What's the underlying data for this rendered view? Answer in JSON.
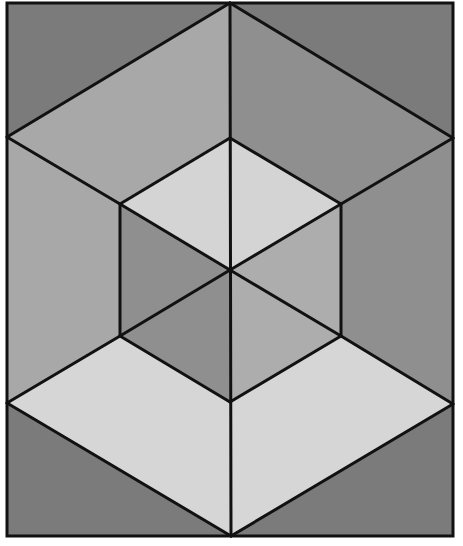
{
  "figure": {
    "width": 463,
    "height": 546,
    "frame": {
      "x": 7,
      "y": 3,
      "w": 446,
      "h": 533
    },
    "stroke_color": "#111111",
    "stroke_width": 3,
    "colors": {
      "dark": "#7b7b7b",
      "medium_dark": "#8c8c8c",
      "medium": "#a3a3a3",
      "light": "#b4b4b4",
      "lightest": "#d6d6d6"
    },
    "regions": [
      {
        "name": "corner-top-left",
        "fill": "#7b7b7b",
        "points": "7,3 230,3 7,137"
      },
      {
        "name": "corner-top-right",
        "fill": "#7b7b7b",
        "points": "230,3 453,3 453,138"
      },
      {
        "name": "corner-bottom-left",
        "fill": "#7b7b7b",
        "points": "7,403 231,536 7,536"
      },
      {
        "name": "corner-bottom-right",
        "fill": "#7b7b7b",
        "points": "453,404 453,536 231,536"
      },
      {
        "name": "upper-left-rhombus",
        "fill": "#a8a8a8",
        "points": "230,3 230,138 120,204 7,137"
      },
      {
        "name": "upper-right-rhombus",
        "fill": "#8f8f8f",
        "points": "230,3 453,138 341,204 230,138"
      },
      {
        "name": "left-side-face",
        "fill": "#a8a8a8",
        "points": "7,137 120,204 120,336 7,403"
      },
      {
        "name": "right-side-face",
        "fill": "#8f8f8f",
        "points": "453,138 453,404 341,336 341,204"
      },
      {
        "name": "inner-top-left",
        "fill": "#d4d4d4",
        "points": "230,138 230,270 120,204"
      },
      {
        "name": "inner-top-right",
        "fill": "#d4d4d4",
        "points": "230,138 341,204 230,270"
      },
      {
        "name": "inner-left",
        "fill": "#8f8f8f",
        "points": "120,204 230,270 120,336"
      },
      {
        "name": "inner-right",
        "fill": "#adadad",
        "points": "341,204 341,336 230,270"
      },
      {
        "name": "inner-bottom-left",
        "fill": "#8f8f8f",
        "points": "120,336 230,270 230,402"
      },
      {
        "name": "inner-bottom-right",
        "fill": "#adadad",
        "points": "230,270 341,336 230,402"
      },
      {
        "name": "lower-left-rhombus",
        "fill": "#d6d6d6",
        "points": "7,403 120,336 230,402 231,536"
      },
      {
        "name": "lower-right-rhombus",
        "fill": "#d6d6d6",
        "points": "231,536 230,402 341,336 453,404"
      }
    ],
    "lines": [
      {
        "name": "center-vertical-line",
        "x1": 230,
        "y1": 3,
        "x2": 231,
        "y2": 536
      },
      {
        "name": "top-left-diagonal",
        "x1": 230,
        "y1": 3,
        "x2": 7,
        "y2": 137
      },
      {
        "name": "top-right-diagonal",
        "x1": 230,
        "y1": 3,
        "x2": 453,
        "y2": 138
      },
      {
        "name": "bottom-left-diagonal",
        "x1": 7,
        "y1": 403,
        "x2": 231,
        "y2": 536
      },
      {
        "name": "bottom-right-diagonal",
        "x1": 453,
        "y1": 404,
        "x2": 231,
        "y2": 536
      },
      {
        "name": "left-upper-edge",
        "x1": 7,
        "y1": 137,
        "x2": 120,
        "y2": 204
      },
      {
        "name": "left-lower-edge",
        "x1": 7,
        "y1": 403,
        "x2": 120,
        "y2": 336
      },
      {
        "name": "right-upper-edge",
        "x1": 453,
        "y1": 138,
        "x2": 341,
        "y2": 204
      },
      {
        "name": "right-lower-edge",
        "x1": 453,
        "y1": 404,
        "x2": 341,
        "y2": 336
      },
      {
        "name": "hex-top-left",
        "x1": 230,
        "y1": 138,
        "x2": 120,
        "y2": 204
      },
      {
        "name": "hex-top-right",
        "x1": 230,
        "y1": 138,
        "x2": 341,
        "y2": 204
      },
      {
        "name": "hex-left",
        "x1": 120,
        "y1": 204,
        "x2": 120,
        "y2": 336
      },
      {
        "name": "hex-right",
        "x1": 341,
        "y1": 204,
        "x2": 341,
        "y2": 336
      },
      {
        "name": "hex-bottom-left",
        "x1": 120,
        "y1": 336,
        "x2": 230,
        "y2": 402
      },
      {
        "name": "hex-bottom-right",
        "x1": 341,
        "y1": 336,
        "x2": 230,
        "y2": 402
      },
      {
        "name": "inner-diag-ul-center",
        "x1": 120,
        "y1": 204,
        "x2": 230,
        "y2": 270
      },
      {
        "name": "inner-diag-ur-center",
        "x1": 341,
        "y1": 204,
        "x2": 230,
        "y2": 270
      },
      {
        "name": "inner-diag-ll-center",
        "x1": 120,
        "y1": 336,
        "x2": 230,
        "y2": 270
      },
      {
        "name": "inner-diag-lr-center",
        "x1": 341,
        "y1": 336,
        "x2": 230,
        "y2": 270
      }
    ]
  }
}
